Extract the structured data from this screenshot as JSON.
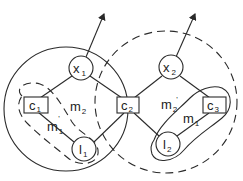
{
  "diagram": {
    "regions": [
      {
        "id": "left-region",
        "style": "solid"
      },
      {
        "id": "right-region",
        "style": "dashed"
      }
    ],
    "nodes": {
      "x1": {
        "main": "x",
        "sub": "1",
        "shape": "circle"
      },
      "x2": {
        "main": "x",
        "sub": "2",
        "shape": "circle"
      },
      "c1": {
        "main": "c",
        "sub": "1",
        "shape": "box"
      },
      "c2": {
        "main": "c",
        "sub": "2",
        "shape": "box"
      },
      "c3": {
        "main": "c",
        "sub": "3",
        "shape": "box"
      },
      "l1": {
        "main": "l",
        "sub": "1",
        "shape": "circle"
      },
      "l2": {
        "main": "l",
        "sub": "2",
        "shape": "circle"
      }
    },
    "labels": {
      "m2_left": {
        "main": "m",
        "sub": "2",
        "prime": ""
      },
      "m1_left": {
        "main": "m",
        "sub": "1",
        "prime": "'"
      },
      "m2_right": {
        "main": "m",
        "sub": "2",
        "prime": "'"
      },
      "m1_right": {
        "main": "m",
        "sub": "1",
        "prime": ""
      }
    },
    "edges": [
      [
        "x1",
        "c1"
      ],
      [
        "x1",
        "c2"
      ],
      [
        "c1",
        "l1"
      ],
      [
        "l1",
        "c2"
      ],
      [
        "x2",
        "c2"
      ],
      [
        "x2",
        "c3"
      ],
      [
        "c2",
        "l2"
      ],
      [
        "l2",
        "c3"
      ]
    ],
    "arrows": [
      {
        "from": "x1",
        "direction": "up-right"
      },
      {
        "from": "x2",
        "direction": "up-right"
      }
    ]
  }
}
